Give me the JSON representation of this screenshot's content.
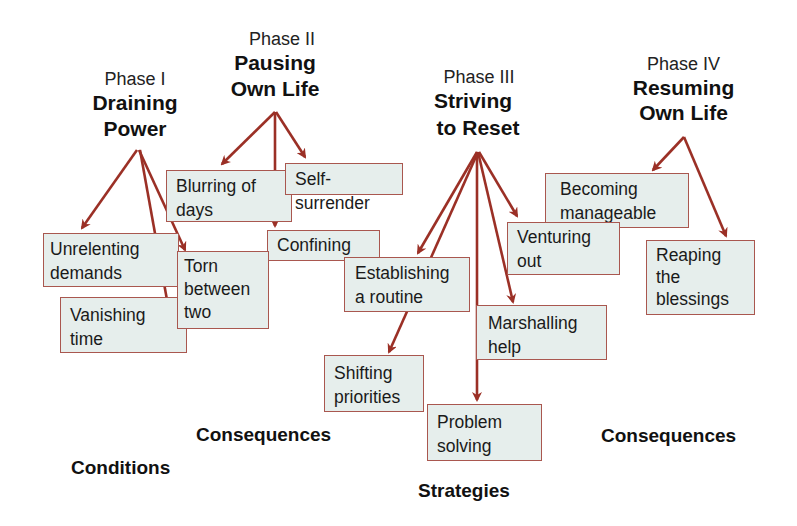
{
  "phases": [
    {
      "id": "phase-1",
      "number": "Phase I",
      "title_line1": "Draining",
      "title_line2": "Power"
    },
    {
      "id": "phase-2",
      "number": "Phase II",
      "title_line1": "Pausing",
      "title_line2": "Own Life"
    },
    {
      "id": "phase-3",
      "number": "Phase III",
      "title_line1": "Striving",
      "title_line2": "to Reset"
    },
    {
      "id": "phase-4",
      "number": "Phase IV",
      "title_line1": "Resuming",
      "title_line2": "Own Life"
    }
  ],
  "boxes": {
    "unrelenting_demands": "Unrelenting\ndemands",
    "vanishing_time": "Vanishing\ntime",
    "torn_between_two": "Torn\nbetween\ntwo",
    "blurring_of_days": "Blurring of\ndays",
    "self_surrender": "Self-surrender",
    "confining": "Confining",
    "establishing_routine": "Establishing\na routine",
    "shifting_priorities": "Shifting\npriorities",
    "problem_solving": "Problem\nsolving",
    "marshalling_help": "Marshalling\nhelp",
    "venturing_out": "Venturing\nout",
    "becoming_manageable": "Becoming\nmanageable",
    "reaping_blessings": "Reaping\nthe\nblessings"
  },
  "categories": {
    "conditions": "Conditions",
    "consequences_1": "Consequences",
    "strategies": "Strategies",
    "consequences_2": "Consequences"
  },
  "colors": {
    "arrow": "#9b3026",
    "box_fill": "#e6eeec",
    "box_border": "#a9574f"
  }
}
